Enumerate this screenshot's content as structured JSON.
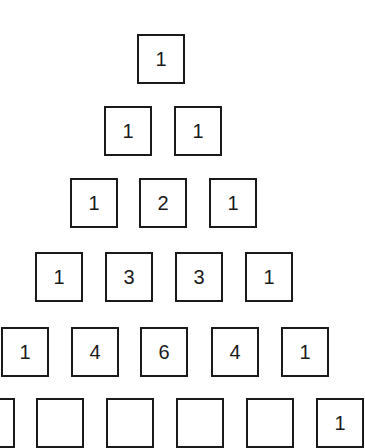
{
  "diagram": {
    "rows": [
      {
        "top": 34,
        "cells": [
          {
            "x": 137,
            "value": "1"
          }
        ]
      },
      {
        "top": 106,
        "cells": [
          {
            "x": 104,
            "value": "1"
          },
          {
            "x": 174,
            "value": "1"
          }
        ]
      },
      {
        "top": 178,
        "cells": [
          {
            "x": 70,
            "value": "1"
          },
          {
            "x": 139,
            "value": "2"
          },
          {
            "x": 209,
            "value": "1"
          }
        ]
      },
      {
        "top": 252,
        "cells": [
          {
            "x": 35,
            "value": "1"
          },
          {
            "x": 105,
            "value": "3"
          },
          {
            "x": 175,
            "value": "3"
          },
          {
            "x": 245,
            "value": "1"
          }
        ]
      },
      {
        "top": 327,
        "cells": [
          {
            "x": 1,
            "value": "1"
          },
          {
            "x": 71,
            "value": "4"
          },
          {
            "x": 140,
            "value": "6"
          },
          {
            "x": 211,
            "value": "4"
          },
          {
            "x": 281,
            "value": "1"
          }
        ]
      },
      {
        "top": 398,
        "cells": [
          {
            "x": -33,
            "value": ""
          },
          {
            "x": 36,
            "value": ""
          },
          {
            "x": 106,
            "value": ""
          },
          {
            "x": 176,
            "value": ""
          },
          {
            "x": 246,
            "value": ""
          },
          {
            "x": 316,
            "value": "1"
          }
        ]
      }
    ]
  }
}
